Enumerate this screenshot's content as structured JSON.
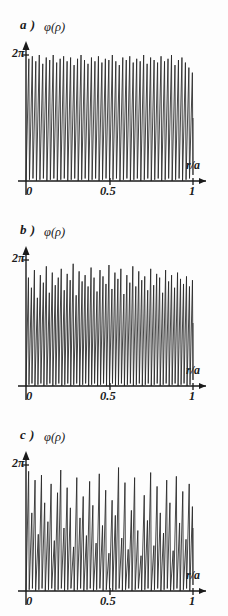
{
  "figure": {
    "background_color": "#fdfdfd",
    "line_color": "#262626",
    "axis_color": "#1a1a1a"
  },
  "panels": [
    {
      "id": "a",
      "label": "a )",
      "ylabel": "φ(ρ)",
      "ytick_label": "2π",
      "xaxis_label": "r/a",
      "xtick_labels": [
        "0",
        "0.5",
        "1"
      ]
    },
    {
      "id": "b",
      "label": "b )",
      "ylabel": "φ(ρ)",
      "ytick_label": "2π",
      "xaxis_label": "r/a",
      "xtick_labels": [
        "0",
        "0.5",
        "1"
      ]
    },
    {
      "id": "c",
      "label": "c )",
      "ylabel": "φ(ρ)",
      "ytick_label": "2π",
      "xaxis_label": "r/a",
      "xtick_labels": [
        "0",
        "0.5",
        "1"
      ]
    }
  ],
  "chart_data": [
    {
      "type": "line",
      "title": "a )",
      "xlabel": "r/a",
      "ylabel": "φ(ρ)",
      "xlim": [
        0,
        1
      ],
      "ylim": [
        0,
        6.283185
      ],
      "xticks": [
        0,
        0.5,
        1
      ],
      "xticklabels": [
        "0",
        "0.5",
        "1"
      ],
      "yticks": [
        6.283185
      ],
      "yticklabels": [
        "2π"
      ],
      "grid": false,
      "legend": "none",
      "description": "Sawtooth-like phase oscillation, regular high-frequency zigzag spanning nearly full 0 to 2pi range, roughly 48 cycles across r/a from 0 to 1, with mild amplitude variation.",
      "n_cycles": 48,
      "amplitude_envelope": [
        0.97,
        0.99,
        0.95,
        1.0,
        0.93,
        0.98,
        0.96,
        1.0,
        0.94,
        0.97,
        0.99,
        0.95,
        0.98,
        0.92,
        0.97,
        1.0,
        0.96,
        0.93,
        0.98,
        0.95,
        0.99,
        0.94,
        0.97,
        0.96,
        1.0,
        0.95,
        0.92,
        0.98,
        0.96,
        0.99,
        0.94,
        0.97,
        0.95,
        1.0,
        0.93,
        0.98,
        0.96,
        0.94,
        0.99,
        0.95,
        0.97,
        1.0,
        0.92,
        0.96,
        0.98,
        0.94,
        0.9,
        0.86
      ]
    },
    {
      "type": "line",
      "title": "b )",
      "xlabel": "r/a",
      "ylabel": "φ(ρ)",
      "xlim": [
        0,
        1
      ],
      "ylim": [
        0,
        6.283185
      ],
      "xticks": [
        0,
        0.5,
        1
      ],
      "xticklabels": [
        "0",
        "0.5",
        "1"
      ],
      "yticks": [
        6.283185
      ],
      "yticklabels": [
        "2π"
      ],
      "grid": false,
      "legend": "none",
      "description": "Higher frequency zigzag phase oscillation with noticeably more peak-height scatter than panel a, about 56 cycles across the interval.",
      "n_cycles": 56,
      "amplitude_envelope": [
        0.86,
        0.78,
        0.92,
        0.7,
        0.88,
        0.82,
        0.95,
        0.74,
        0.9,
        0.8,
        0.86,
        0.93,
        0.76,
        0.89,
        0.84,
        0.97,
        0.72,
        0.91,
        0.83,
        0.88,
        0.79,
        0.94,
        0.86,
        0.75,
        0.92,
        0.87,
        0.81,
        0.96,
        0.77,
        0.9,
        0.85,
        0.93,
        0.73,
        0.88,
        0.82,
        0.95,
        0.79,
        0.91,
        0.84,
        0.87,
        0.76,
        0.93,
        0.8,
        0.89,
        0.86,
        0.74,
        0.92,
        0.83,
        0.88,
        0.78,
        0.9,
        0.85,
        0.81,
        0.87,
        0.79,
        0.84
      ]
    },
    {
      "type": "line",
      "title": "c )",
      "xlabel": "r/a",
      "ylabel": "φ(ρ)",
      "xlim": [
        0,
        1
      ],
      "ylim": [
        0,
        6.283185
      ],
      "xticks": [
        0,
        0.5,
        1
      ],
      "xticklabels": [
        "0",
        "0.5",
        "1"
      ],
      "yticks": [
        6.283185
      ],
      "yticklabels": [
        "2π"
      ],
      "grid": false,
      "legend": "none",
      "description": "Irregular chaotic phase oscillation with strong amplitude modulation; bursts of near-full 2pi swings alternate with compressed low-amplitude segments, especially near r/a = 0.45 to 0.6.",
      "n_cycles": 52,
      "amplitude_envelope": [
        0.95,
        0.62,
        0.88,
        0.45,
        0.92,
        0.7,
        0.55,
        0.85,
        0.4,
        0.78,
        0.96,
        0.5,
        0.82,
        0.66,
        0.35,
        0.9,
        0.58,
        0.75,
        0.44,
        0.87,
        0.68,
        0.38,
        0.93,
        0.52,
        0.8,
        0.3,
        0.72,
        0.6,
        0.98,
        0.42,
        0.86,
        0.33,
        0.64,
        0.9,
        0.48,
        0.28,
        0.76,
        0.56,
        0.94,
        0.36,
        0.83,
        0.62,
        0.46,
        0.88,
        0.7,
        0.32,
        0.91,
        0.54,
        0.79,
        0.41,
        0.85,
        0.67
      ]
    }
  ]
}
